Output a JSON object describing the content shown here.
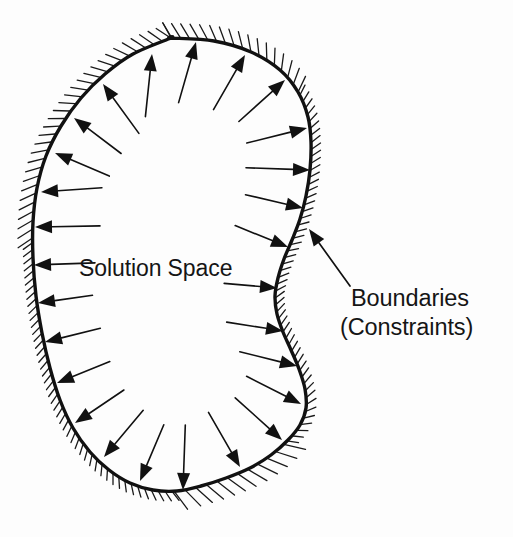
{
  "figure": {
    "type": "diagram",
    "background_color": "#fdfdfd",
    "ink_color": "#111111",
    "width": 513,
    "height": 537
  },
  "labels": {
    "solution_space": "Solution Space",
    "boundaries": "Boundaries",
    "constraints": "(Constraints)"
  },
  "region": {
    "name": "solution-space-region",
    "outline_stroke_width": 3.4,
    "closed": true,
    "path_points": [
      [
        171,
        38
      ],
      [
        214,
        41
      ],
      [
        251,
        52
      ],
      [
        280,
        70
      ],
      [
        298,
        92
      ],
      [
        308,
        117
      ],
      [
        311,
        142
      ],
      [
        310,
        170
      ],
      [
        306,
        196
      ],
      [
        300,
        219
      ],
      [
        292,
        240
      ],
      [
        284,
        259
      ],
      [
        278,
        278
      ],
      [
        275,
        296
      ],
      [
        277,
        314
      ],
      [
        283,
        332
      ],
      [
        291,
        350
      ],
      [
        299,
        369
      ],
      [
        305,
        389
      ],
      [
        306,
        408
      ],
      [
        300,
        425
      ],
      [
        288,
        440
      ],
      [
        271,
        455
      ],
      [
        250,
        468
      ],
      [
        226,
        478
      ],
      [
        201,
        486
      ],
      [
        177,
        491
      ],
      [
        153,
        490
      ],
      [
        130,
        483
      ],
      [
        109,
        470
      ],
      [
        90,
        452
      ],
      [
        73,
        428
      ],
      [
        60,
        400
      ],
      [
        50,
        368
      ],
      [
        42,
        333
      ],
      [
        36,
        296
      ],
      [
        33,
        258
      ],
      [
        33,
        222
      ],
      [
        37,
        188
      ],
      [
        46,
        156
      ],
      [
        61,
        126
      ],
      [
        81,
        98
      ],
      [
        105,
        74
      ],
      [
        133,
        54
      ],
      [
        171,
        38
      ]
    ]
  },
  "hatching": {
    "name": "constraint-hatching",
    "side": "outside",
    "description": "short slanted tick marks drawn on the outer side of the boundary curve",
    "tick_color": "#1a1a1a",
    "tick_width": 1.3,
    "segments": [
      {
        "from_t": 0.0,
        "to_t": 0.12,
        "length": 17,
        "spacing": 9
      },
      {
        "from_t": 0.12,
        "to_t": 0.42,
        "length": 11,
        "spacing": 7
      },
      {
        "from_t": 0.42,
        "to_t": 0.52,
        "length": 22,
        "spacing": 11
      },
      {
        "from_t": 0.52,
        "to_t": 0.78,
        "length": 11,
        "spacing": 7
      },
      {
        "from_t": 0.78,
        "to_t": 1.0,
        "length": 17,
        "spacing": 9
      }
    ]
  },
  "arrows": {
    "name": "outward-constraint-arrows",
    "count": 26,
    "direction": "outward from interior toward boundary",
    "head_style": "solid-filled-triangle",
    "head_length": 17,
    "head_width": 13,
    "tail_width": 1.6,
    "items": [
      {
        "tip": [
          152,
          54
        ],
        "tail_len": 46,
        "angle_deg": -84
      },
      {
        "tip": [
          196,
          42
        ],
        "tail_len": 46,
        "angle_deg": -74
      },
      {
        "tip": [
          103,
          84
        ],
        "tail_len": 44,
        "angle_deg": -126
      },
      {
        "tip": [
          245,
          55
        ],
        "tail_len": 46,
        "angle_deg": -60
      },
      {
        "tip": [
          74,
          118
        ],
        "tail_len": 42,
        "angle_deg": -143
      },
      {
        "tip": [
          285,
          80
        ],
        "tail_len": 45,
        "angle_deg": -42
      },
      {
        "tip": [
          55,
          153
        ],
        "tail_len": 42,
        "angle_deg": -157
      },
      {
        "tip": [
          307,
          128
        ],
        "tail_len": 45,
        "angle_deg": -14
      },
      {
        "tip": [
          41,
          192
        ],
        "tail_len": 44,
        "angle_deg": 176
      },
      {
        "tip": [
          310,
          170
        ],
        "tail_len": 47,
        "angle_deg": 2
      },
      {
        "tip": [
          35,
          227
        ],
        "tail_len": 48,
        "angle_deg": 179
      },
      {
        "tip": [
          303,
          208
        ],
        "tail_len": 42,
        "angle_deg": 13
      },
      {
        "tip": [
          34,
          265
        ],
        "tail_len": 44,
        "angle_deg": 178
      },
      {
        "tip": [
          288,
          247
        ],
        "tail_len": 40,
        "angle_deg": 22
      },
      {
        "tip": [
          38,
          303
        ],
        "tail_len": 38,
        "angle_deg": 172
      },
      {
        "tip": [
          277,
          288
        ],
        "tail_len": 36,
        "angle_deg": 5
      },
      {
        "tip": [
          45,
          342
        ],
        "tail_len": 40,
        "angle_deg": 166
      },
      {
        "tip": [
          283,
          331
        ],
        "tail_len": 40,
        "angle_deg": 9
      },
      {
        "tip": [
          57,
          383
        ],
        "tail_len": 40,
        "angle_deg": 158
      },
      {
        "tip": [
          297,
          366
        ],
        "tail_len": 42,
        "angle_deg": 14
      },
      {
        "tip": [
          75,
          423
        ],
        "tail_len": 42,
        "angle_deg": 146
      },
      {
        "tip": [
          301,
          404
        ],
        "tail_len": 44,
        "angle_deg": 27
      },
      {
        "tip": [
          104,
          457
        ],
        " tail_len": 44,
        "angle_deg": 130
      },
      {
        "tip": [
          282,
          440
        ],
        "tail_len": 46,
        "angle_deg": 42
      },
      {
        "tip": [
          140,
          481
        ],
        "tail_len": 44,
        "angle_deg": 113
      },
      {
        "tip": [
          240,
          467
        ],
        "tail_len": 46,
        "angle_deg": 60
      },
      {
        "tip": [
          183,
          490
        ],
        "tail_len": 48,
        "angle_deg": 92
      }
    ]
  },
  "leader": {
    "name": "boundaries-leader-line",
    "from": [
      350,
      286
    ],
    "to": [
      309,
      229
    ],
    "head_length": 17,
    "head_width": 13,
    "stroke_width": 1.7
  }
}
